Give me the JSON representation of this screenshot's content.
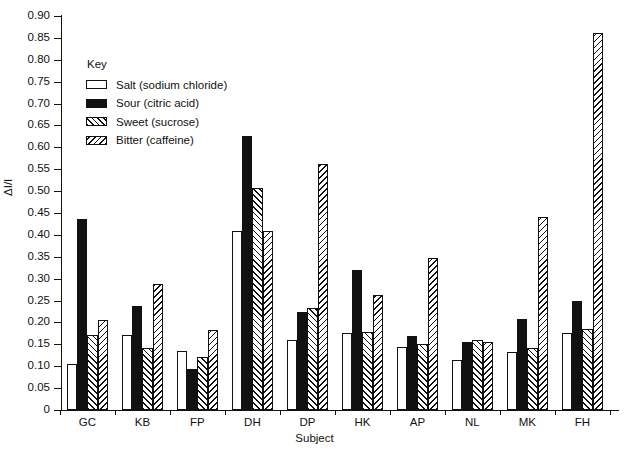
{
  "chart_data": {
    "type": "bar",
    "title": "",
    "xlabel": "Subject",
    "ylabel": "ΔI/I",
    "ylim": [
      0,
      0.9
    ],
    "ytick_step": 0.05,
    "grid": false,
    "legend_position": "inside-upper-left",
    "legend_title": "Key",
    "categories": [
      "GC",
      "KB",
      "FP",
      "DH",
      "DP",
      "HK",
      "AP",
      "NL",
      "MK",
      "FH"
    ],
    "ytick_labels": [
      "0.90",
      "0.85",
      "0.80",
      "0.75",
      "0.70",
      "0.65",
      "0.60",
      "0.55",
      "0.50",
      "0.45",
      "0.40",
      "0.35",
      "0.30",
      "0.25",
      "0.20",
      "0.15",
      "0.10",
      "0.05",
      "0"
    ],
    "ytick_values": [
      0.9,
      0.85,
      0.8,
      0.75,
      0.7,
      0.65,
      0.6,
      0.55,
      0.5,
      0.45,
      0.4,
      0.35,
      0.3,
      0.25,
      0.2,
      0.15,
      0.1,
      0.05,
      0
    ],
    "series": [
      {
        "name": "Salt (sodium chloride)",
        "key": "salt",
        "pattern": "open-white",
        "color": "#ffffff",
        "values": [
          0.105,
          0.172,
          0.135,
          0.408,
          0.16,
          0.175,
          0.143,
          0.115,
          0.133,
          0.175
        ]
      },
      {
        "name": "Sour (citric acid)",
        "key": "sour",
        "pattern": "solid-black",
        "color": "#111111",
        "values": [
          0.437,
          0.238,
          0.093,
          0.625,
          0.225,
          0.32,
          0.168,
          0.155,
          0.208,
          0.248
        ]
      },
      {
        "name": "Sweet (sucrose)",
        "key": "sweet",
        "pattern": "forward-diagonal-hatch",
        "color": "#111111",
        "values": [
          0.172,
          0.142,
          0.122,
          0.508,
          0.233,
          0.178,
          0.15,
          0.16,
          0.142,
          0.185
        ]
      },
      {
        "name": "Bitter (caffeine)",
        "key": "bitter",
        "pattern": "backward-diagonal-hatch",
        "color": "#111111",
        "values": [
          0.205,
          0.287,
          0.182,
          0.41,
          0.563,
          0.262,
          0.348,
          0.155,
          0.44,
          0.862
        ]
      }
    ]
  }
}
